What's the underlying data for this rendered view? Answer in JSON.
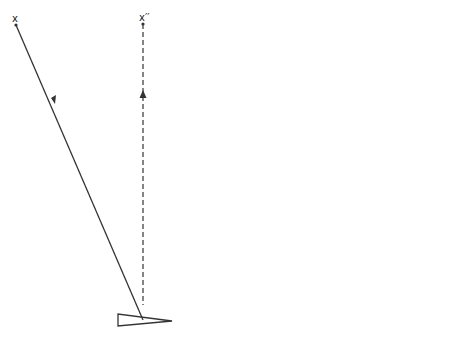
{
  "diagram": {
    "panel_a": {
      "caption": "(a)",
      "source_label": "x",
      "image_label": "x′′"
    },
    "panel_b": {
      "caption": "(b)",
      "source_label": "x",
      "image_label": "x′"
    },
    "colors": {
      "line": "#333333",
      "background": "#ffffff"
    }
  }
}
